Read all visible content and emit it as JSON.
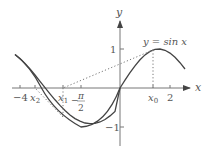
{
  "diagram": {
    "curve_label": "y = sin x",
    "axis_x_label": "x",
    "axis_y_label": "y",
    "y_ticks": [
      {
        "label": "1",
        "value": 1
      },
      {
        "label": "−1",
        "value": -1
      }
    ],
    "x_ticks": [
      {
        "label": "−4",
        "value": -4
      },
      {
        "label": "x",
        "sub": "2",
        "value": -3.4
      },
      {
        "label": "x",
        "sub": "1",
        "value": -2.28
      },
      {
        "label": "π",
        "den": "2",
        "sign": "−",
        "value": -1.5708
      },
      {
        "label": "x",
        "sub": "0",
        "value": 1.33
      },
      {
        "label": "2",
        "value": 2
      }
    ],
    "x_range": [
      -4.2,
      2.6
    ],
    "y_range": [
      -1.6,
      1.9
    ],
    "colors": {
      "curve": "#444444",
      "axes": "#666666",
      "dotted": "#777777",
      "text": "#555555"
    }
  }
}
